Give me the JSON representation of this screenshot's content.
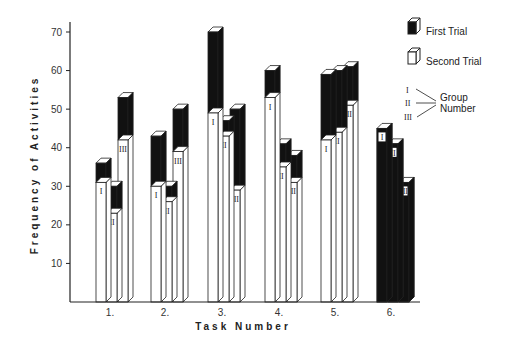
{
  "chart_data": {
    "type": "bar",
    "subtype": "3d-overlapping-stacked",
    "title": "",
    "xlabel": "Task Number",
    "ylabel": "Frequency of Activities",
    "ylim": [
      0,
      70
    ],
    "yticks": [
      10,
      20,
      30,
      40,
      50,
      60,
      70
    ],
    "grid": false,
    "categories": [
      "1.",
      "2.",
      "3.",
      "4.",
      "5.",
      "6."
    ],
    "groups": [
      "I",
      "II",
      "III"
    ],
    "series": [
      {
        "name": "First Trial",
        "fill": "#111111",
        "values": {
          "I": [
            36,
            43,
            70,
            60,
            59,
            45
          ],
          "II": [
            30,
            30,
            47,
            41,
            60,
            41
          ],
          "III": [
            53,
            50,
            50,
            38,
            61,
            31
          ]
        }
      },
      {
        "name": "Second Trial",
        "fill": "#ffffff",
        "values": {
          "I": [
            31,
            30,
            49,
            53,
            42,
            0
          ],
          "II": [
            23,
            26,
            43,
            35,
            44,
            0
          ],
          "III": [
            42,
            39,
            29,
            31,
            51,
            0
          ]
        }
      }
    ],
    "legend": {
      "position": "top-right",
      "entries": [
        "First Trial",
        "Second Trial"
      ],
      "group_key": {
        "labels": [
          "I",
          "II",
          "III"
        ],
        "caption": "Group Number"
      }
    }
  },
  "labels": {
    "ylabel": "Frequency of Activities",
    "xlabel": "Task Number",
    "legend_first": "First Trial",
    "legend_second": "Second Trial",
    "group_caption_1": "Group",
    "group_caption_2": "Number"
  }
}
